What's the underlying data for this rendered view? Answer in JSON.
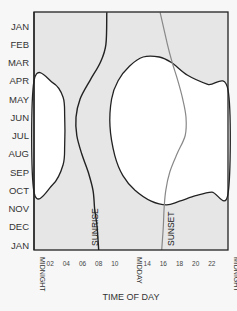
{
  "chart_data": {
    "type": "line",
    "title": "",
    "xlabel": "TIME OF DAY",
    "ylabel": "",
    "xlim": [
      0,
      24
    ],
    "ylim": [
      0,
      12
    ],
    "y_tick_labels": [
      "JAN",
      "FEB",
      "MAR",
      "APR",
      "MAY",
      "JUN",
      "JUL",
      "AUG",
      "SEP",
      "OCT",
      "NOV",
      "DEC",
      "JAN"
    ],
    "x_ticks": [
      {
        "h": 0,
        "label": "MIDNIGHT",
        "vertical": true
      },
      {
        "h": 2,
        "label": "02"
      },
      {
        "h": 4,
        "label": "04"
      },
      {
        "h": 6,
        "label": "06"
      },
      {
        "h": 8,
        "label": "08"
      },
      {
        "h": 10,
        "label": "10"
      },
      {
        "h": 12,
        "label": "MIDDAY",
        "vertical": true
      },
      {
        "h": 14,
        "label": "14"
      },
      {
        "h": 16,
        "label": "16"
      },
      {
        "h": 18,
        "label": "18"
      },
      {
        "h": 20,
        "label": "20"
      },
      {
        "h": 22,
        "label": "22"
      },
      {
        "h": 24,
        "label": "MIDNIGHT",
        "vertical": true
      }
    ],
    "series": [
      {
        "name": "SUNRISE",
        "color": "#222222",
        "months": [
          -0.75,
          1,
          2,
          3,
          4,
          5,
          6,
          7,
          8,
          9,
          10,
          11,
          12.3
        ],
        "hours": [
          9.0,
          8.9,
          8.2,
          6.9,
          5.7,
          5.2,
          5.3,
          5.9,
          6.7,
          7.3,
          7.5,
          7.8,
          8.0
        ]
      },
      {
        "name": "SUNSET",
        "color": "#888888",
        "months": [
          -0.75,
          1,
          2,
          3,
          4,
          5,
          6,
          7,
          8,
          9,
          10,
          11,
          12.3
        ],
        "hours": [
          15.6,
          16.5,
          17.1,
          17.8,
          18.4,
          18.8,
          18.7,
          17.7,
          16.8,
          16.3,
          16.1,
          16.0,
          15.8
        ]
      }
    ],
    "regions": [
      {
        "name": "left-white-region",
        "fill": "#ffffff",
        "outline": [
          [
            0,
            3
          ],
          [
            2.3,
            3.1
          ],
          [
            3.6,
            3.9
          ],
          [
            3.8,
            5
          ],
          [
            3.8,
            6.5
          ],
          [
            3.6,
            7.6
          ],
          [
            2.3,
            8.7
          ],
          [
            0,
            9.1
          ]
        ]
      },
      {
        "name": "right-white-region",
        "fill": "#ffffff",
        "outline": [
          [
            9.4,
            5.5
          ],
          [
            9.6,
            4
          ],
          [
            10.4,
            3
          ],
          [
            11.8,
            2.2
          ],
          [
            13.5,
            1.7
          ],
          [
            15.5,
            1.7
          ],
          [
            17,
            2
          ],
          [
            19,
            2.7
          ],
          [
            21.5,
            3.2
          ],
          [
            24,
            3.5
          ],
          [
            24,
            9.2
          ],
          [
            22,
            9.1
          ],
          [
            20,
            9.3
          ],
          [
            18,
            9.6
          ],
          [
            16.4,
            9.8
          ],
          [
            14.5,
            9.6
          ],
          [
            12.5,
            9
          ],
          [
            11,
            8.2
          ],
          [
            10,
            7.1
          ]
        ]
      }
    ],
    "background_fill": "#e6e6e6",
    "grid": false,
    "legend": "none"
  }
}
